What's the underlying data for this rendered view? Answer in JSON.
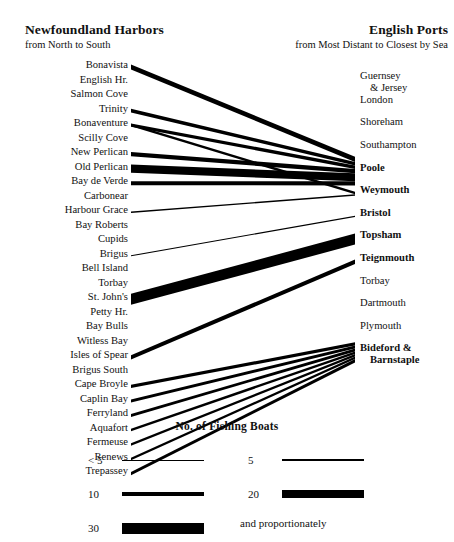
{
  "header": {
    "left_title": "Newfoundland Harbors",
    "left_subtitle": "from North to South",
    "right_title": "English Ports",
    "right_subtitle": "from Most Distant to Closest by Sea"
  },
  "left_column": {
    "items": [
      {
        "label": "Bonavista"
      },
      {
        "label": "English Hr."
      },
      {
        "label": "Salmon Cove"
      },
      {
        "label": "Trinity"
      },
      {
        "label": "Bonaventure"
      },
      {
        "label": "Scilly Cove"
      },
      {
        "label": "New Perlican"
      },
      {
        "label": "Old Perlican"
      },
      {
        "label": "Bay de Verde"
      },
      {
        "label": "Carbonear"
      },
      {
        "label": "Harbour Grace"
      },
      {
        "label": "Bay Roberts"
      },
      {
        "label": "Cupids"
      },
      {
        "label": "Brigus"
      },
      {
        "label": "Bell Island"
      },
      {
        "label": "Torbay"
      },
      {
        "label": "St. John's"
      },
      {
        "label": "Petty Hr."
      },
      {
        "label": "Bay Bulls"
      },
      {
        "label": "Witless Bay"
      },
      {
        "label": "Isles of Spear"
      },
      {
        "label": "Brigus South"
      },
      {
        "label": "Cape Broyle"
      },
      {
        "label": "Caplin Bay"
      },
      {
        "label": "Ferryland"
      },
      {
        "label": "Aquafort"
      },
      {
        "label": "Fermeuse"
      },
      {
        "label": "Renews"
      },
      {
        "label": "Trepassey"
      }
    ]
  },
  "right_column": {
    "items": [
      {
        "label": "Guernsey",
        "label2": "& Jersey",
        "bold": false
      },
      {
        "label": "London",
        "label2": "",
        "bold": false
      },
      {
        "label": "Shoreham",
        "label2": "",
        "bold": false
      },
      {
        "label": "Southampton",
        "label2": "",
        "bold": false
      },
      {
        "label": "Poole",
        "label2": "",
        "bold": true
      },
      {
        "label": "Weymouth",
        "label2": "",
        "bold": true
      },
      {
        "label": "Bristol",
        "label2": "",
        "bold": true
      },
      {
        "label": "Topsham",
        "label2": "",
        "bold": true
      },
      {
        "label": "Teignmouth",
        "label2": "",
        "bold": true
      },
      {
        "label": "Torbay",
        "label2": "",
        "bold": false
      },
      {
        "label": "Dartmouth",
        "label2": "",
        "bold": false
      },
      {
        "label": "Plymouth",
        "label2": "",
        "bold": false
      },
      {
        "label": "Bideford &",
        "label2": "Barnstaple",
        "bold": true
      }
    ]
  },
  "legend": {
    "title": "No.  of Fishing Boats",
    "entries": [
      {
        "label": "< 5",
        "width": 1.0,
        "col": 0,
        "row": 0
      },
      {
        "label": "5",
        "width": 2.2,
        "col": 1,
        "row": 0
      },
      {
        "label": "10",
        "width": 4.0,
        "col": 0,
        "row": 1
      },
      {
        "label": "20",
        "width": 7.5,
        "col": 1,
        "row": 1
      },
      {
        "label": "30",
        "width": 11.0,
        "col": 0,
        "row": 2
      }
    ],
    "note": "and proportionately"
  },
  "chart_data": {
    "type": "sankey",
    "unit": "fishing boats",
    "source_axis": "Newfoundland Harbors (North to South)",
    "target_axis": "English Ports (Most Distant to Closest by Sea)",
    "sources": [
      "Bonavista",
      "English Hr.",
      "Salmon Cove",
      "Trinity",
      "Bonaventure",
      "Scilly Cove",
      "New Perlican",
      "Old Perlican",
      "Bay de Verde",
      "Carbonear",
      "Harbour Grace",
      "Bay Roberts",
      "Cupids",
      "Brigus",
      "Bell Island",
      "Torbay",
      "St. John's",
      "Petty Hr.",
      "Bay Bulls",
      "Witless Bay",
      "Isles of Spear",
      "Brigus South",
      "Cape Broyle",
      "Caplin Bay",
      "Ferryland",
      "Aquafort",
      "Fermeuse",
      "Renews",
      "Trepassey"
    ],
    "targets": [
      "Guernsey & Jersey",
      "London",
      "Shoreham",
      "Southampton",
      "Poole",
      "Weymouth",
      "Bristol",
      "Topsham",
      "Teignmouth",
      "Torbay",
      "Dartmouth",
      "Plymouth",
      "Bideford & Barnstaple"
    ],
    "links": [
      {
        "source": "Bonavista",
        "target": "Poole",
        "value": 14
      },
      {
        "source": "Trinity",
        "target": "Poole",
        "value": 10
      },
      {
        "source": "Bonaventure",
        "target": "Weymouth",
        "value": 7
      },
      {
        "source": "Bonaventure",
        "target": "Poole",
        "value": 9
      },
      {
        "source": "New Perlican",
        "target": "Poole",
        "value": 12
      },
      {
        "source": "Old Perlican",
        "target": "Poole",
        "value": 22
      },
      {
        "source": "Bay de Verde",
        "target": "Poole",
        "value": 11
      },
      {
        "source": "Harbour Grace",
        "target": "Weymouth",
        "value": 4
      },
      {
        "source": "Brigus",
        "target": "Bristol",
        "value": 3
      },
      {
        "source": "St. John's",
        "target": "Topsham",
        "value": 30
      },
      {
        "source": "Isles of Spear",
        "target": "Teignmouth",
        "value": 12
      },
      {
        "source": "Cape Broyle",
        "target": "Bideford & Barnstaple",
        "value": 9
      },
      {
        "source": "Caplin Bay",
        "target": "Bideford & Barnstaple",
        "value": 8
      },
      {
        "source": "Ferryland",
        "target": "Bideford & Barnstaple",
        "value": 8
      },
      {
        "source": "Aquafort",
        "target": "Bideford & Barnstaple",
        "value": 7
      },
      {
        "source": "Fermeuse",
        "target": "Bideford & Barnstaple",
        "value": 7
      },
      {
        "source": "Renews",
        "target": "Bideford & Barnstaple",
        "value": 7
      },
      {
        "source": "Trepassey",
        "target": "Bideford & Barnstaple",
        "value": 9
      }
    ]
  }
}
